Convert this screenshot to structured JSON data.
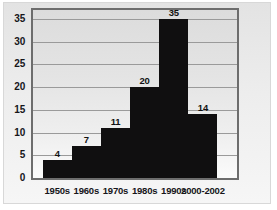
{
  "chart_data": {
    "type": "bar",
    "title": "",
    "subtitle": "",
    "xlabel": "",
    "ylabel": "",
    "categories": [
      "1950s",
      "1960s",
      "1970s",
      "1980s",
      "1990s",
      "2000-2002"
    ],
    "values": [
      4,
      7,
      11,
      20,
      35,
      14
    ],
    "value_labels": [
      "4",
      "7",
      "11",
      "20",
      "35",
      "14"
    ],
    "ylim": [
      0,
      37
    ],
    "yticks": [
      0,
      5,
      10,
      15,
      20,
      25,
      30,
      35
    ],
    "ytick_labels": [
      "0",
      "5",
      "10",
      "15",
      "20",
      "25",
      "30",
      "35"
    ],
    "grid": true,
    "grid_axis": "y",
    "legend": false,
    "legend_position": "none",
    "bar_style": "contiguous-histogram",
    "colors": {
      "bar": "#100f10",
      "plot_background": "#e4e4e4",
      "plot_border": "#6d6d6d",
      "gridline": "#9a9a9a",
      "text": "#16161a",
      "page_background": "#ffffff"
    }
  }
}
